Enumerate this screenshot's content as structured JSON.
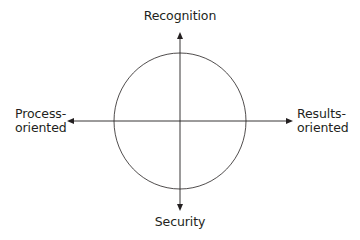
{
  "diagram": {
    "type": "quadrant-axes",
    "axes": {
      "vertical": {
        "top_label": "Recognition",
        "bottom_label": "Security"
      },
      "horizontal": {
        "left_label_line1": "Process-",
        "left_label_line2": "oriented",
        "right_label_line1": "Results-",
        "right_label_line2": "oriented"
      }
    },
    "shapes": {
      "circle": "circle centered at axes intersection"
    },
    "colors": {
      "line": "#231f20",
      "text": "#231f20",
      "background": "#ffffff"
    }
  }
}
